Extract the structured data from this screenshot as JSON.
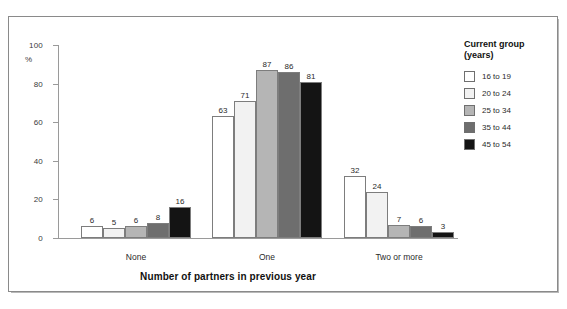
{
  "chart_data": {
    "type": "bar",
    "title": "",
    "xlabel": "Number of partners in previous year",
    "ylabel": "%",
    "ylim": [
      0,
      100
    ],
    "yticks": [
      0,
      20,
      40,
      60,
      80,
      100
    ],
    "grid": false,
    "legend_position": "right",
    "legend_title": "Current group\n(years)",
    "categories": [
      "None",
      "One",
      "Two or more"
    ],
    "series": [
      {
        "name": "16 to 19",
        "color": "#ffffff",
        "values": [
          6,
          63,
          32
        ]
      },
      {
        "name": "20 to 24",
        "color": "#f2f2f2",
        "values": [
          5,
          71,
          24
        ]
      },
      {
        "name": "25 to 34",
        "color": "#b5b5b5",
        "values": [
          6,
          87,
          7
        ]
      },
      {
        "name": "35 to 44",
        "color": "#6e6e6e",
        "values": [
          8,
          86,
          6
        ]
      },
      {
        "name": "45 to 54",
        "color": "#141414",
        "values": [
          16,
          81,
          3
        ]
      }
    ]
  }
}
